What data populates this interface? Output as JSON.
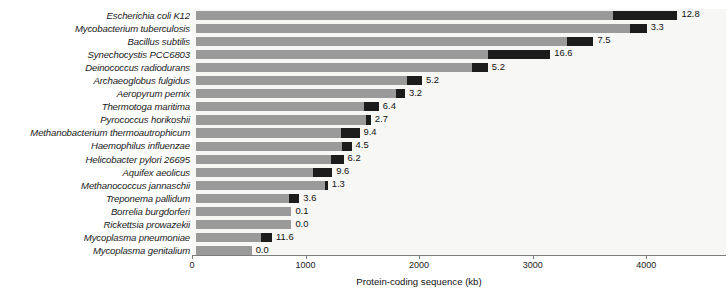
{
  "chart_data": {
    "type": "bar",
    "title": "",
    "subtitle": "",
    "xlabel": "Protein-coding sequence (kb)",
    "ylabel": "",
    "orientation": "horizontal",
    "grid": false,
    "legend": null,
    "xlim": [
      0,
      4700
    ],
    "xticks": [
      0,
      1000,
      2000,
      3000,
      4000
    ],
    "xticklabels": [
      "0",
      "1000",
      "2000",
      "3000",
      "4000"
    ],
    "categories": [
      "Escherichia coli K12",
      "Mycobacterium tuberculosis",
      "Bacillus subtilis",
      "Synechocystis PCC6803",
      "Deinococcus radiodurans",
      "Archaeoglobus fulgidus",
      "Aeropyrum pernix",
      "Thermotoga maritima",
      "Pyrococcus horikoshii",
      "Methanobacterium thermoautrophicum",
      "Haemophilus influenzae",
      "Helicobacter pylori 26695",
      "Aquifex aeolicus",
      "Methanococcus jannaschii",
      "Treponema pallidum",
      "Borrelia burgdorferi",
      "Rickettsia prowazekii",
      "Mycoplasma pneumoniae",
      "Mycoplasma genitalium"
    ],
    "series": [
      {
        "name": "Protein-coding sequence (kb)",
        "color": "#9a9a9a",
        "values": [
          4240,
          3970,
          3500,
          3120,
          2570,
          1990,
          1840,
          1610,
          1540,
          1440,
          1370,
          1300,
          1200,
          1160,
          910,
          840,
          840,
          670,
          490
        ]
      },
      {
        "name": "Highlighted segment",
        "color": "#1c1c1c",
        "values": [
          570,
          150,
          235,
          550,
          140,
          135,
          75,
          130,
          45,
          160,
          85,
          115,
          170,
          25,
          90,
          0,
          0,
          100,
          0
        ]
      }
    ],
    "data_labels": [
      "12.8",
      "3.3",
      "7.5",
      "16.6",
      "5.2",
      "5.2",
      "3.2",
      "6.4",
      "2.7",
      "9.4",
      "4.5",
      "6.2",
      "9.6",
      "1.3",
      "3.6",
      "0.1",
      "0.0",
      "11.6",
      "0.0"
    ],
    "colors": {
      "bar_gray": "#9a9a9a",
      "bar_black": "#1c1c1c",
      "plot_background": "#f7f7f5",
      "axis": "#7d7d7d",
      "text": "#111111"
    }
  },
  "axis": {
    "xlabel": "Protein-coding sequence (kb)",
    "ticks": [
      {
        "label": "0",
        "value": 0
      },
      {
        "label": "1000",
        "value": 1000
      },
      {
        "label": "2000",
        "value": 2000
      },
      {
        "label": "3000",
        "value": 3000
      },
      {
        "label": "4000",
        "value": 4000
      }
    ]
  }
}
